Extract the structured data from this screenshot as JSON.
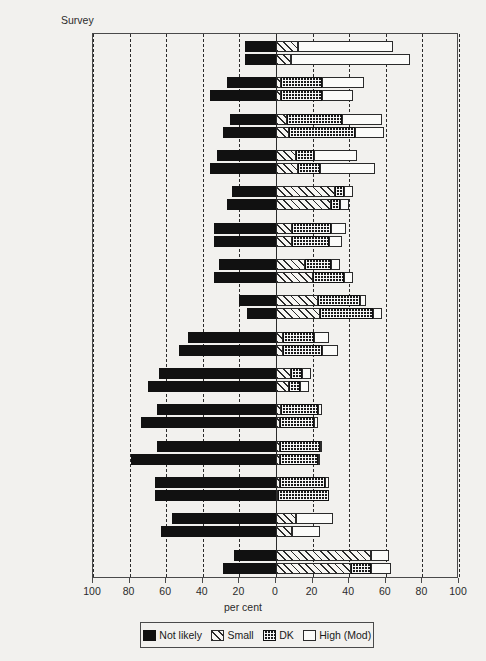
{
  "axis_title_y": "Survey",
  "xlabel": "per cent",
  "xticks": [
    "100",
    "80",
    "60",
    "40",
    "20",
    "0",
    "20",
    "40",
    "60",
    "80",
    "100"
  ],
  "legend": [
    {
      "key": "not_likely",
      "label": "Not likely",
      "swatch": "solid-black"
    },
    {
      "key": "small",
      "label": "Small",
      "swatch": "diagonal-hatch"
    },
    {
      "key": "dk",
      "label": "DK",
      "swatch": "dotted-dark"
    },
    {
      "key": "high",
      "label": "High (Mod)",
      "swatch": "white-outline"
    }
  ],
  "chart_data": {
    "type": "bar",
    "orientation": "horizontal",
    "stacked": true,
    "diverging": true,
    "title": "",
    "xlabel": "per cent",
    "ylabel": "Survey",
    "xlim": [
      -100,
      100
    ],
    "xticks": [
      -100,
      -80,
      -60,
      -40,
      -20,
      0,
      20,
      40,
      60,
      80,
      100
    ],
    "grid": "vertical dashed at every 20",
    "legend_position": "bottom",
    "series": [
      "Not likely",
      "Small",
      "DK",
      "High (Mod)"
    ],
    "note": "Not likely plotted left of zero (negative); Small, DK, High (Mod) stacked right of zero",
    "categories": [
      "CAR M",
      "CAR - F",
      "Côte d'Ivoire M",
      "Côte d'Ivoire - F",
      "Guinea Bissau M",
      "Guinea Bissau - F",
      "Togo M",
      "Togo - F",
      "Burundi M",
      "Burundi - F",
      "Kenya M",
      "Kenya - F",
      "Lesotho M",
      "Lesotho - F",
      "Tanzania M",
      "Tanzania - F",
      "Lusaka M",
      "Lusaka - F",
      "Mauritius M",
      "Mauritius - F",
      "Manila M",
      "Manila - F",
      "Singapore M",
      "Singapore - F",
      "Sri Lanka M",
      "Sri Lanka - F",
      "Thailand M",
      "Thailand - F",
      "Rio de Janeiro M",
      "Rio de Janeiro - F"
    ],
    "rows": [
      {
        "group": "CAR",
        "sex": "M",
        "not_likely": 17,
        "small": 12,
        "dk": 0,
        "high": 52
      },
      {
        "group": "CAR",
        "sex": "F",
        "not_likely": 17,
        "small": 8,
        "dk": 0,
        "high": 65
      },
      {
        "group": "Côte d'Ivoire",
        "sex": "M",
        "not_likely": 27,
        "small": 3,
        "dk": 22,
        "high": 23
      },
      {
        "group": "Côte d'Ivoire",
        "sex": "F",
        "not_likely": 36,
        "small": 3,
        "dk": 22,
        "high": 17
      },
      {
        "group": "Guinea Bissau",
        "sex": "M",
        "not_likely": 25,
        "small": 6,
        "dk": 30,
        "high": 22
      },
      {
        "group": "Guinea Bissau",
        "sex": "F",
        "not_likely": 29,
        "small": 7,
        "dk": 36,
        "high": 16
      },
      {
        "group": "Togo",
        "sex": "M",
        "not_likely": 32,
        "small": 11,
        "dk": 10,
        "high": 23
      },
      {
        "group": "Togo",
        "sex": "F",
        "not_likely": 36,
        "small": 12,
        "dk": 12,
        "high": 30
      },
      {
        "group": "Burundi",
        "sex": "M",
        "not_likely": 24,
        "small": 32,
        "dk": 5,
        "high": 5
      },
      {
        "group": "Burundi",
        "sex": "F",
        "not_likely": 27,
        "small": 30,
        "dk": 5,
        "high": 5
      },
      {
        "group": "Kenya",
        "sex": "M",
        "not_likely": 34,
        "small": 9,
        "dk": 21,
        "high": 8
      },
      {
        "group": "Kenya",
        "sex": "F",
        "not_likely": 34,
        "small": 9,
        "dk": 20,
        "high": 7
      },
      {
        "group": "Lesotho",
        "sex": "M",
        "not_likely": 31,
        "small": 16,
        "dk": 14,
        "high": 5
      },
      {
        "group": "Lesotho",
        "sex": "F",
        "not_likely": 34,
        "small": 20,
        "dk": 17,
        "high": 5
      },
      {
        "group": "Tanzania",
        "sex": "M",
        "not_likely": 20,
        "small": 23,
        "dk": 23,
        "high": 3
      },
      {
        "group": "Tanzania",
        "sex": "F",
        "not_likely": 16,
        "small": 24,
        "dk": 29,
        "high": 5
      },
      {
        "group": "Lusaka",
        "sex": "M",
        "not_likely": 48,
        "small": 4,
        "dk": 17,
        "high": 8
      },
      {
        "group": "Lusaka",
        "sex": "F",
        "not_likely": 53,
        "small": 4,
        "dk": 21,
        "high": 9
      },
      {
        "group": "Mauritius",
        "sex": "M",
        "not_likely": 64,
        "small": 8,
        "dk": 6,
        "high": 5
      },
      {
        "group": "Mauritius",
        "sex": "F",
        "not_likely": 70,
        "small": 7,
        "dk": 6,
        "high": 5
      },
      {
        "group": "Manila",
        "sex": "M",
        "not_likely": 65,
        "small": 3,
        "dk": 20,
        "high": 2
      },
      {
        "group": "Manila",
        "sex": "F",
        "not_likely": 74,
        "small": 2,
        "dk": 19,
        "high": 2
      },
      {
        "group": "Singapore",
        "sex": "M",
        "not_likely": 65,
        "small": 2,
        "dk": 22,
        "high": 1
      },
      {
        "group": "Singapore",
        "sex": "F",
        "not_likely": 79,
        "small": 2,
        "dk": 21,
        "high": 1
      },
      {
        "group": "Sri Lanka",
        "sex": "M",
        "not_likely": 66,
        "small": 2,
        "dk": 25,
        "high": 2
      },
      {
        "group": "Sri Lanka",
        "sex": "F",
        "not_likely": 66,
        "small": 1,
        "dk": 28,
        "high": 0
      },
      {
        "group": "Thailand",
        "sex": "M",
        "not_likely": 57,
        "small": 11,
        "dk": 0,
        "high": 20
      },
      {
        "group": "Thailand",
        "sex": "F",
        "not_likely": 63,
        "small": 9,
        "dk": 0,
        "high": 15
      },
      {
        "group": "Rio de Janeiro",
        "sex": "M",
        "not_likely": 23,
        "small": 52,
        "dk": 0,
        "high": 10
      },
      {
        "group": "Rio de Janeiro",
        "sex": "F",
        "not_likely": 29,
        "small": 41,
        "dk": 11,
        "high": 11
      }
    ]
  },
  "ylabels": [
    "CAR M",
    "- F",
    "Côte d'Ivoire M",
    "- F",
    "Guinea Bissau M",
    "- F",
    "Togo M",
    "- F",
    "Burundi M",
    "- F",
    "Kenya M",
    "- F",
    "Lesotho M",
    "- F",
    "Tanzania M",
    "- F",
    "Lusaka M",
    "- F",
    "Mauritius M",
    "- F",
    "Manila M",
    "- F",
    "Singapore M",
    "- F",
    "Sri Lanka M",
    "- F",
    "Thailand M",
    "- F",
    "Rio de Janeiro M",
    "- F"
  ]
}
